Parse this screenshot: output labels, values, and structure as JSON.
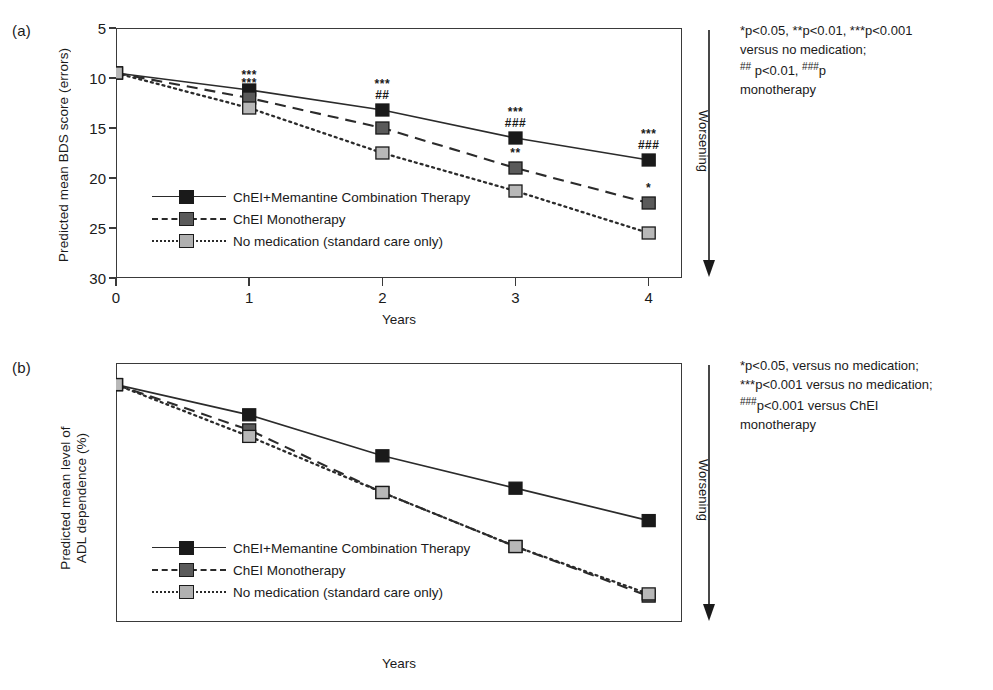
{
  "figure": {
    "panels": [
      {
        "tag": "(a)",
        "ylabel": "Predicted mean BDS score (errors)",
        "ylabel_lines": [
          "Predicted mean BDS score (errors)"
        ],
        "xlabel": "Years",
        "worsening_label": "Worsening",
        "yticks": [
          5,
          10,
          15,
          20,
          25,
          30
        ],
        "xticks": [
          0,
          1,
          2,
          3,
          4
        ],
        "note_lines": [
          "*p<0.05, **p<0.01, ***p<0.001",
          "versus no medication;",
          "## p<0.01, ###p<p<0.001 versus ChEI",
          "monotherapy"
        ],
        "legend": [
          {
            "label": "ChEI+Memantine Combination Therapy",
            "style": "solid",
            "color": "#1a1a1a"
          },
          {
            "label": "ChEI Monotherapy",
            "style": "dashed",
            "color": "#5a5a5a"
          },
          {
            "label": "No medication (standard care only)",
            "style": "dotted",
            "color": "#b0b0b0"
          }
        ],
        "annotations": [
          {
            "series": 0,
            "x": 1,
            "lines": [
              "***"
            ]
          },
          {
            "series": 0,
            "x": 2,
            "lines": [
              "***",
              "##"
            ]
          },
          {
            "series": 0,
            "x": 3,
            "lines": [
              "***",
              "###"
            ]
          },
          {
            "series": 0,
            "x": 4,
            "lines": [
              "***",
              "###"
            ]
          },
          {
            "series": 1,
            "x": 1,
            "lines": [
              "***"
            ]
          },
          {
            "series": 1,
            "x": 2,
            "lines": [
              "**"
            ]
          },
          {
            "series": 1,
            "x": 3,
            "lines": [
              "**"
            ]
          },
          {
            "series": 1,
            "x": 4,
            "lines": [
              "*"
            ]
          }
        ]
      },
      {
        "tag": "(b)",
        "ylabel": "Predicted mean level of ADL dependence (%)",
        "ylabel_lines": [
          "Predicted mean level of",
          "ADL dependence (%)"
        ],
        "xlabel": "Years",
        "worsening_label": "Worsening",
        "yticks": [
          20,
          30,
          40,
          50,
          60,
          70,
          80
        ],
        "xticks": [
          0,
          1,
          2,
          3,
          4
        ],
        "note_lines": [
          "*p<0.05, versus no medication;",
          "***p<0.001 versus no medication;",
          "###p<0.001 versus ChEI",
          "monotherapy"
        ],
        "legend": [
          {
            "label": "ChEI+Memantine Combination Therapy",
            "style": "solid",
            "color": "#1a1a1a"
          },
          {
            "label": "ChEI Monotherapy",
            "style": "dashed",
            "color": "#5a5a5a"
          },
          {
            "label": "No medication (standard care only)",
            "style": "dotted",
            "color": "#b0b0b0"
          }
        ],
        "annotations": [
          {
            "series": 0,
            "x": 1,
            "lines": [
              "*"
            ]
          },
          {
            "series": 0,
            "x": 2,
            "lines": [
              "***",
              "###"
            ]
          },
          {
            "series": 0,
            "x": 3,
            "lines": [
              "***",
              "###"
            ]
          },
          {
            "series": 0,
            "x": 4,
            "lines": [
              "***",
              "###"
            ]
          }
        ]
      }
    ]
  },
  "chart_data": [
    {
      "type": "line",
      "panel": "(a)",
      "title": "",
      "xlabel": "Years",
      "ylabel": "Predicted mean BDS score (errors)",
      "x": [
        0,
        1,
        2,
        3,
        4
      ],
      "xlim": [
        0,
        4.25
      ],
      "ylim": [
        5,
        30
      ],
      "y_inverted": true,
      "grid": false,
      "legend_position": "inside-bottom-left",
      "series": [
        {
          "name": "ChEI+Memantine Combination Therapy",
          "style": "solid",
          "marker_color": "#1a1a1a",
          "values": [
            9.5,
            11.2,
            13.2,
            16.0,
            18.2
          ]
        },
        {
          "name": "ChEI Monotherapy",
          "style": "dashed",
          "marker_color": "#5a5a5a",
          "values": [
            9.5,
            12.0,
            15.0,
            19.0,
            22.5
          ]
        },
        {
          "name": "No medication (standard care only)",
          "style": "dotted",
          "marker_color": "#b8b8b8",
          "values": [
            9.5,
            13.0,
            17.5,
            21.3,
            25.5
          ]
        }
      ]
    },
    {
      "type": "line",
      "panel": "(b)",
      "title": "",
      "xlabel": "Years",
      "ylabel": "Predicted mean level of ADL dependence (%)",
      "x": [
        0,
        1,
        2,
        3,
        4
      ],
      "xlim": [
        0,
        4.25
      ],
      "ylim": [
        20,
        80
      ],
      "y_inverted": true,
      "grid": false,
      "legend_position": "inside-bottom-left",
      "series": [
        {
          "name": "ChEI+Memantine Combination Therapy",
          "style": "solid",
          "marker_color": "#1a1a1a",
          "values": [
            25.0,
            32.0,
            41.5,
            49.0,
            56.5
          ]
        },
        {
          "name": "ChEI Monotherapy",
          "style": "dashed",
          "marker_color": "#5a5a5a",
          "values": [
            25.0,
            35.5,
            50.0,
            62.5,
            74.0
          ]
        },
        {
          "name": "No medication (standard care only)",
          "style": "dotted",
          "marker_color": "#b8b8b8",
          "values": [
            25.0,
            37.0,
            50.0,
            62.5,
            73.5
          ]
        }
      ]
    }
  ]
}
